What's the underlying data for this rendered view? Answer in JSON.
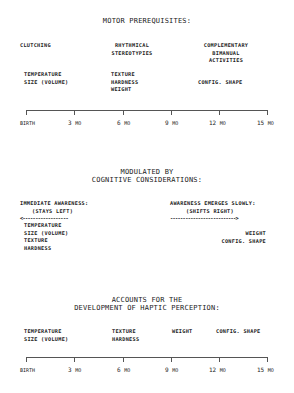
{
  "section1": {
    "title": "MOTOR PREREQUISITES:",
    "motor": [
      {
        "label": "CLUTCHING"
      },
      {
        "label": "RHYTHMICAL\nSTEREOTYPIES"
      },
      {
        "label": "COMPLEMENTARY\nBIMANUAL\nACTIVITIES"
      }
    ],
    "properties": [
      {
        "label": "TEMPERATURE\nSIZE (VOLUME)"
      },
      {
        "label": "TEXTURE\nHARDNESS\nWEIGHT"
      },
      {
        "label": "CONFIG. SHAPE"
      }
    ],
    "timeline": [
      {
        "num": "",
        "unit": "BIRTH"
      },
      {
        "num": "3",
        "unit": "MO"
      },
      {
        "num": "6",
        "unit": "MO"
      },
      {
        "num": "9",
        "unit": "MO"
      },
      {
        "num": "12",
        "unit": "MO"
      },
      {
        "num": "15",
        "unit": "MO"
      }
    ]
  },
  "section2": {
    "title": "MODULATED BY\nCOGNITIVE CONSIDERATIONS:",
    "left": {
      "heading": "IMMEDIATE AWARENESS:",
      "sub": "(STAYS LEFT)",
      "arrow": "<------------------",
      "items": "TEMPERATURE\nSIZE (VOLUME)\nTEXTURE\nHARDNESS"
    },
    "right": {
      "heading": "AWARENESS EMERGES SLOWLY:",
      "sub": "(SHIFTS RIGHT)",
      "arrow": "-------------------------->",
      "items": "WEIGHT\nCONFIG. SHAPE"
    }
  },
  "section3": {
    "title": "ACCOUNTS FOR THE\nDEVELOPMENT OF HAPTIC PERCEPTION:",
    "properties": [
      {
        "label": "TEMPERATURE\nSIZE (VOLUME)"
      },
      {
        "label": "TEXTURE\nHARDNESS"
      },
      {
        "label": "WEIGHT"
      },
      {
        "label": "CONFIG. SHAPE"
      }
    ],
    "timeline": [
      {
        "num": "",
        "unit": "BIRTH"
      },
      {
        "num": "3",
        "unit": "MO"
      },
      {
        "num": "6",
        "unit": "MO"
      },
      {
        "num": "9",
        "unit": "MO"
      },
      {
        "num": "12",
        "unit": "MO"
      },
      {
        "num": "15",
        "unit": "MO"
      }
    ]
  }
}
